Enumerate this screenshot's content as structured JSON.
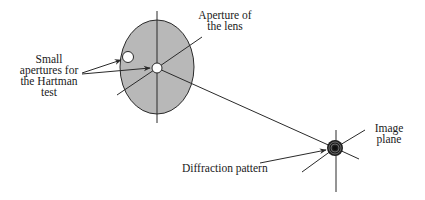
{
  "diagram": {
    "labels": {
      "small_apertures": [
        "Small",
        "apertures for",
        "the Hartman",
        "test"
      ],
      "lens_aperture": [
        "Aperture of",
        "the lens"
      ],
      "diffraction": "Diffraction pattern",
      "image_plane": [
        "Image",
        "plane"
      ]
    },
    "colors": {
      "lens_fill": "#b8b8b8",
      "stroke": "#2a2a2a",
      "background": "#ffffff"
    }
  }
}
